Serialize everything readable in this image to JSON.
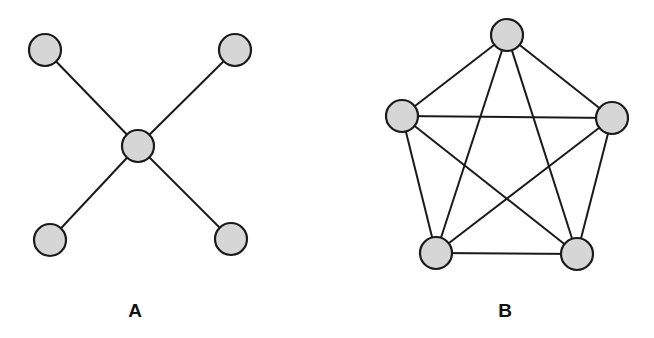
{
  "colors": {
    "node_fill": "#d6d6d6",
    "stroke": "#1a1a1a",
    "background": "#ffffff"
  },
  "diagrams": [
    {
      "label": "A",
      "type": "star",
      "label_pos": [
        135,
        317
      ],
      "node_radius": 16,
      "nodes": [
        {
          "id": "center",
          "x": 138,
          "y": 146
        },
        {
          "id": "top-left",
          "x": 45,
          "y": 50
        },
        {
          "id": "top-right",
          "x": 235,
          "y": 50
        },
        {
          "id": "bottom-left",
          "x": 50,
          "y": 240
        },
        {
          "id": "bottom-right",
          "x": 231,
          "y": 239
        }
      ],
      "edges": [
        [
          "center",
          "top-left"
        ],
        [
          "center",
          "top-right"
        ],
        [
          "center",
          "bottom-left"
        ],
        [
          "center",
          "bottom-right"
        ]
      ]
    },
    {
      "label": "B",
      "type": "complete-graph-K5",
      "label_pos": [
        505,
        317
      ],
      "node_radius": 16,
      "nodes": [
        {
          "id": "top",
          "x": 507,
          "y": 35
        },
        {
          "id": "left",
          "x": 402,
          "y": 116
        },
        {
          "id": "right",
          "x": 612,
          "y": 118
        },
        {
          "id": "bottom-left",
          "x": 436,
          "y": 253
        },
        {
          "id": "bottom-right",
          "x": 577,
          "y": 254
        }
      ],
      "edges": [
        [
          "top",
          "left"
        ],
        [
          "top",
          "right"
        ],
        [
          "top",
          "bottom-left"
        ],
        [
          "top",
          "bottom-right"
        ],
        [
          "left",
          "right"
        ],
        [
          "left",
          "bottom-left"
        ],
        [
          "left",
          "bottom-right"
        ],
        [
          "right",
          "bottom-left"
        ],
        [
          "right",
          "bottom-right"
        ],
        [
          "bottom-left",
          "bottom-right"
        ]
      ]
    }
  ]
}
